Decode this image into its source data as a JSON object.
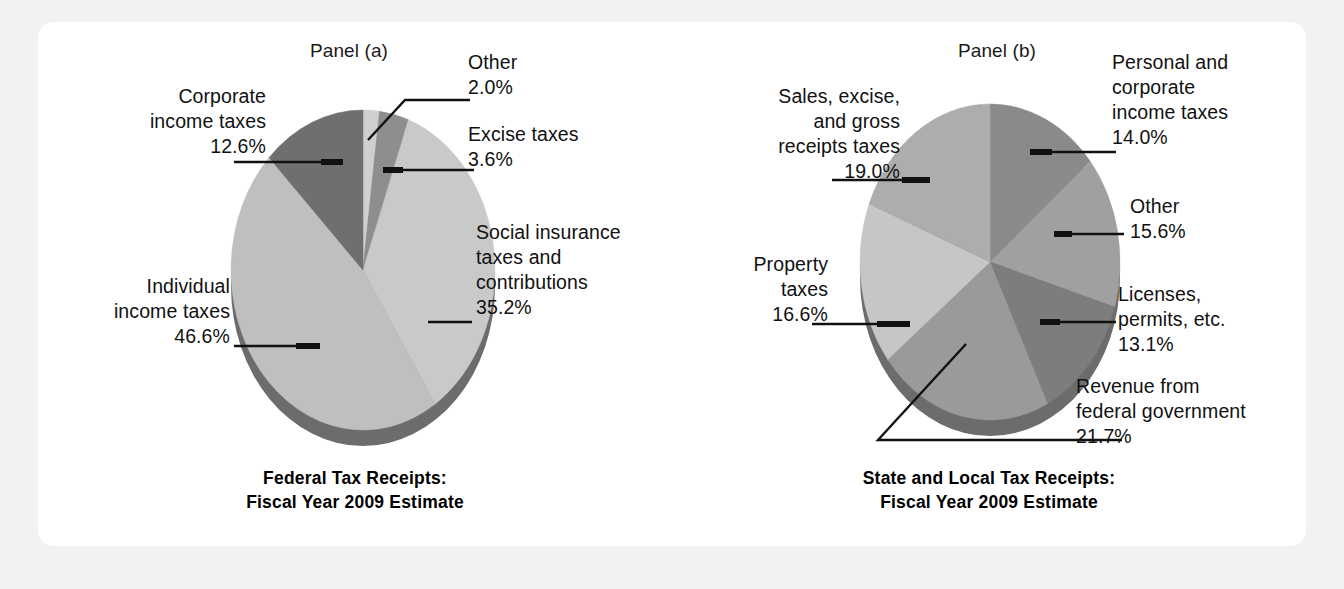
{
  "figure": {
    "background_color": "#f2f2f2",
    "card_color": "#ffffff"
  },
  "panel_a": {
    "panel_label": "Panel (a)",
    "caption": "Federal Tax Receipts:\nFiscal Year 2009 Estimate",
    "labels": {
      "corporate": "Corporate\nincome taxes\n12.6%",
      "other": "Other\n2.0%",
      "excise": "Excise taxes\n3.6%",
      "social": "Social insurance\ntaxes and\ncontributions\n35.2%",
      "individual": "Individual\nincome taxes\n46.6%"
    }
  },
  "panel_b": {
    "panel_label": "Panel (b)",
    "caption": "State and Local Tax Receipts:\nFiscal Year 2009 Estimate",
    "labels": {
      "sales": "Sales, excise,\nand gross\nreceipts taxes\n19.0%",
      "personal": "Personal and\ncorporate\nincome taxes\n14.0%",
      "other": "Other\n15.6%",
      "licenses": "Licenses,\npermits, etc.\n13.1%",
      "revenue": "Revenue from\nfederal government\n21.7%",
      "property": "Property\ntaxes\n16.6%"
    }
  },
  "chart_data": [
    {
      "type": "pie",
      "id": "federal-tax-receipts",
      "title": "Federal Tax Receipts: Fiscal Year 2009 Estimate",
      "panel": "Panel (a)",
      "unit": "percent",
      "start_angle_deg": 0,
      "direction": "clockwise",
      "categories": [
        "Other",
        "Excise taxes",
        "Social insurance taxes and contributions",
        "Individual income taxes",
        "Corporate income taxes"
      ],
      "values": [
        2.0,
        3.6,
        35.2,
        46.6,
        12.6
      ],
      "colors": [
        "#cfcfcf",
        "#8e8e8e",
        "#c9c9c9",
        "#bfbfbf",
        "#6f6f6f"
      ],
      "legend": "none",
      "labels_as_callouts": true
    },
    {
      "type": "pie",
      "id": "state-and-local-tax-receipts",
      "title": "State and Local Tax Receipts: Fiscal Year 2009 Estimate",
      "panel": "Panel (b)",
      "unit": "percent",
      "start_angle_deg": 0,
      "direction": "clockwise",
      "categories": [
        "Personal and corporate income taxes",
        "Other",
        "Licenses, permits, etc.",
        "Revenue from federal government",
        "Property taxes",
        "Sales, excise, and gross receipts taxes"
      ],
      "values": [
        14.0,
        15.6,
        13.1,
        21.7,
        16.6,
        19.0
      ],
      "colors": [
        "#8a8a8a",
        "#a0a0a0",
        "#7d7d7d",
        "#9a9a9a",
        "#c6c6c6",
        "#adadad"
      ],
      "legend": "none",
      "labels_as_callouts": true
    }
  ]
}
